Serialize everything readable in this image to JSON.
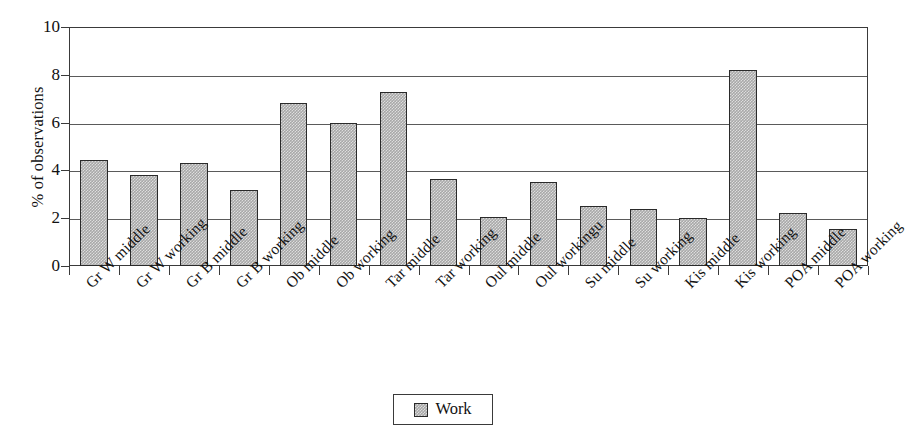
{
  "chart_data": {
    "type": "bar",
    "title": "",
    "xlabel": "",
    "ylabel": "% of observations",
    "ylim": [
      0,
      10
    ],
    "ytick_values": [
      0,
      2,
      4,
      6,
      8,
      10
    ],
    "ytick_labels": [
      "0",
      "2",
      "4",
      "6",
      "8",
      "10"
    ],
    "grid": "horizontal",
    "legend_position": "bottom-center",
    "categories": [
      "Gr W middle",
      "Gr W working",
      "Gr B middle",
      "Gr B working",
      "Ob middle",
      "Ob working",
      "Tar middle",
      "Tar working",
      "Oul middle",
      "Oul workingu",
      "Su  middle",
      "Su working",
      "Kis middle",
      "Kis working",
      "POA middle",
      "POA working"
    ],
    "series": [
      {
        "name": "Work",
        "color": "#a8a8a8",
        "values": [
          4.45,
          3.8,
          4.3,
          3.2,
          6.8,
          6.0,
          7.3,
          3.65,
          2.05,
          3.5,
          2.5,
          2.4,
          2.0,
          8.2,
          2.2,
          1.55
        ]
      }
    ]
  },
  "legend": {
    "entries": [
      {
        "label": "Work",
        "swatch": "legend-swatch-work"
      }
    ]
  },
  "colors": {
    "bar_fill": "#a8a8a8",
    "bar_border": "#2a2a2a",
    "axis": "#3a3a3a",
    "gridline": "#5a5a5a",
    "background": "#ffffff",
    "text": "#111111"
  }
}
